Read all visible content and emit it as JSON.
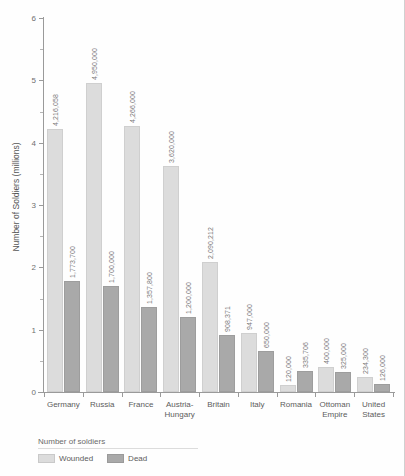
{
  "chart_data": {
    "type": "bar",
    "title": "",
    "xlabel": "",
    "ylabel": "Number of Soldiers (millions)",
    "ylim": [
      0,
      6
    ],
    "yticks": [
      0,
      1,
      2,
      3,
      4,
      5,
      6
    ],
    "ytick_labels": [
      "0",
      "1",
      "2",
      "3",
      "4",
      "5",
      "6"
    ],
    "grid": false,
    "legend_position": "bottom-left",
    "legend_title": "Number of soldiers",
    "categories": [
      "Germany",
      "Russia",
      "France",
      "Austria-Hungary",
      "Britain",
      "Italy",
      "Romania",
      "Ottoman Empire",
      "United States"
    ],
    "series": [
      {
        "name": "Wounded",
        "color": "#dcdcdc",
        "values": [
          4216058,
          4950000,
          4266000,
          3620000,
          2090212,
          947000,
          120000,
          400000,
          234300
        ],
        "labels": [
          "4,216,058",
          "4,950,000",
          "4,266,000",
          "3,620,000",
          "2,090,212",
          "947,000",
          "120,000",
          "400,000",
          "234,300"
        ]
      },
      {
        "name": "Dead",
        "color": "#a9a9a9",
        "values": [
          1773700,
          1700000,
          1357800,
          1200000,
          908371,
          650000,
          335706,
          325000,
          126000
        ],
        "labels": [
          "1,773,700",
          "1,700,000",
          "1,357,800",
          "1,200,000",
          "908,371",
          "650,000",
          "335,706",
          "325,000",
          "126,000"
        ]
      }
    ]
  },
  "axis": {
    "y_title": "Number of Soldiers (millions)"
  },
  "legend": {
    "title": "Number of soldiers",
    "items": [
      {
        "label": "Wounded",
        "color": "#dcdcdc"
      },
      {
        "label": "Dead",
        "color": "#a9a9a9"
      }
    ]
  }
}
